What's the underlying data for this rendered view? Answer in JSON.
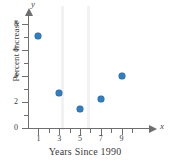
{
  "chart_data": {
    "type": "scatter",
    "title": "",
    "xlabel": "Years Since 1990",
    "ylabel": "Percent Increase",
    "x_axis_variable": "x",
    "y_axis_variable": "y",
    "xlim": [
      0,
      10
    ],
    "ylim": [
      0,
      8.6
    ],
    "grid": false,
    "legend": null,
    "x_ticks_major": [
      1,
      3,
      5,
      7,
      9
    ],
    "x_ticks_minor": [
      2,
      4,
      6,
      8,
      10
    ],
    "y_ticks_major": [
      0,
      2,
      4,
      6,
      8
    ],
    "y_ticks_minor": [
      1,
      3,
      5,
      7
    ],
    "x_tick_labels": [
      "1",
      "3",
      "5",
      "7",
      "9"
    ],
    "y_tick_labels": [
      "0",
      "2",
      "4",
      "6",
      "8"
    ],
    "point_color": "#2e7fc4",
    "axis_color": "#6e6e6e",
    "x": [
      1,
      3,
      5,
      7,
      9
    ],
    "values": [
      7.1,
      2.7,
      1.5,
      2.2,
      4.0
    ],
    "points": [
      {
        "x": 1,
        "y": 7.1
      },
      {
        "x": 3,
        "y": 2.7
      },
      {
        "x": 5,
        "y": 1.5
      },
      {
        "x": 7,
        "y": 2.2
      },
      {
        "x": 9,
        "y": 4.0
      }
    ]
  }
}
